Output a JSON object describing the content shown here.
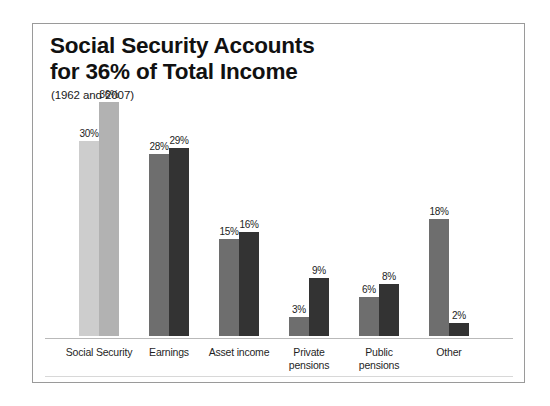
{
  "chart_data": {
    "type": "bar",
    "title": "Social Security Accounts\nfor 36% of Total Income",
    "subtitle": "(1962 and 2007)",
    "categories": [
      "Social Security",
      "Earnings",
      "Asset income",
      "Private\npensions",
      "Public\npensions",
      "Other"
    ],
    "series": [
      {
        "name": "1962",
        "values": [
          30,
          28,
          15,
          3,
          6,
          18
        ],
        "labels": [
          "30%",
          "28%",
          "15%",
          "3%",
          "6%",
          "18%"
        ]
      },
      {
        "name": "2007",
        "values": [
          36,
          29,
          16,
          9,
          8,
          2
        ],
        "labels": [
          "36%",
          "29%",
          "16%",
          "9%",
          "8%",
          "2%"
        ]
      }
    ],
    "ylim": [
      0,
      40
    ],
    "xlabel": "",
    "ylabel": "",
    "grid": false,
    "legend": "none",
    "value_suffix": "%",
    "colors": {
      "series_1_default": "#6e6e6e",
      "series_2_default": "#333333",
      "series_1_first_group": "#cdcdcd",
      "series_2_first_group": "#b2b2b2",
      "baseline": "#b9b9b9",
      "frame": "#9a9a9a",
      "text": "#1a1a1a",
      "background": "#ffffff"
    }
  }
}
